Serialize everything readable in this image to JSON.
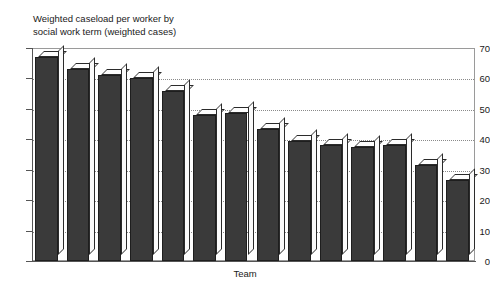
{
  "top_ghost_text": "",
  "chart_data": {
    "type": "bar",
    "title": "Weighted caseload per worker by social work term (weighted cases)",
    "title_line1": "Weighted caseload per worker by",
    "title_line2": "social work term (weighted cases)",
    "xlabel": "Team",
    "ylabel": "",
    "ylim": [
      0,
      70
    ],
    "ytick_step": 10,
    "ytick_labels": [
      "0",
      "10",
      "20",
      "30",
      "40",
      "50",
      "60",
      "70"
    ],
    "ytick_values": [
      0,
      10,
      20,
      30,
      40,
      50,
      60,
      70
    ],
    "grid": "horizontal-dotted",
    "legend": "none",
    "bar_style": "3d-block",
    "bar_color": "#3a3a3a",
    "bar_top_color": "#fdfdfd",
    "categories": [
      "1",
      "2",
      "3",
      "4",
      "5",
      "6",
      "7",
      "8",
      "9",
      "10",
      "11",
      "12",
      "13",
      "14"
    ],
    "values": [
      67,
      63,
      61,
      60,
      56,
      48,
      48.5,
      43.5,
      39.5,
      38,
      37.5,
      38,
      31.5,
      26.5
    ]
  }
}
